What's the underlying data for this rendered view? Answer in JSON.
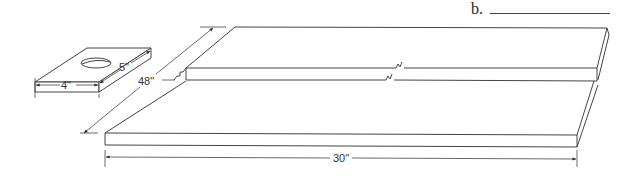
{
  "question": {
    "label": "b.",
    "answer_value": ""
  },
  "block": {
    "name": "small block with hole",
    "width_label": "4\"",
    "depth_label": "5\""
  },
  "board": {
    "name": "long board with break lines",
    "length_label": "48\"",
    "width_label": "30\""
  },
  "colors": {
    "line": "#444444",
    "background": "#ffffff"
  }
}
